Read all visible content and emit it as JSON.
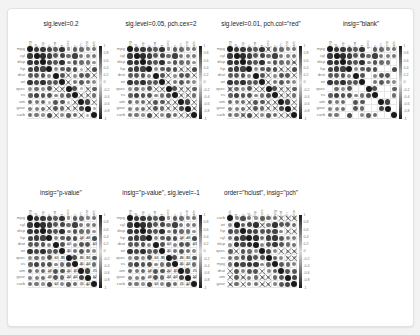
{
  "chart_data": {
    "type": "heatmap",
    "subtype": "correlation matrix (corrplot circles)",
    "variables": [
      "mpg",
      "cyl",
      "disp",
      "hp",
      "drat",
      "wt",
      "qsec",
      "vs",
      "am",
      "gear",
      "carb"
    ],
    "hclust_order": [
      "carb",
      "wt",
      "hp",
      "cyl",
      "disp",
      "qsec",
      "vs",
      "mpg",
      "drat",
      "am",
      "gear"
    ],
    "colorbar_ticks": [
      "1",
      "0.8",
      "0.6",
      "0.4",
      "0.2",
      "0",
      "-0.2",
      "-0.4",
      "-0.6",
      "-0.8",
      "-1"
    ],
    "legend_position": "right",
    "grid": true,
    "correlation": [
      [
        1.0,
        -0.85,
        -0.85,
        -0.78,
        0.68,
        -0.87,
        0.42,
        0.66,
        0.6,
        0.48,
        -0.55
      ],
      [
        -0.85,
        1.0,
        0.9,
        0.83,
        -0.7,
        0.78,
        -0.59,
        -0.81,
        -0.52,
        -0.49,
        0.53
      ],
      [
        -0.85,
        0.9,
        1.0,
        0.79,
        -0.71,
        0.89,
        -0.43,
        -0.71,
        -0.59,
        -0.56,
        0.39
      ],
      [
        -0.78,
        0.83,
        0.79,
        1.0,
        -0.45,
        0.66,
        -0.71,
        -0.72,
        -0.24,
        -0.13,
        0.75
      ],
      [
        0.68,
        -0.7,
        -0.71,
        -0.45,
        1.0,
        -0.71,
        0.09,
        0.44,
        0.71,
        0.7,
        -0.09
      ],
      [
        -0.87,
        0.78,
        0.89,
        0.66,
        -0.71,
        1.0,
        -0.17,
        -0.55,
        -0.69,
        -0.58,
        0.43
      ],
      [
        0.42,
        -0.59,
        -0.43,
        -0.71,
        0.09,
        -0.17,
        1.0,
        0.74,
        -0.23,
        -0.21,
        -0.66
      ],
      [
        0.66,
        -0.81,
        -0.71,
        -0.72,
        0.44,
        -0.55,
        0.74,
        1.0,
        0.17,
        0.21,
        -0.57
      ],
      [
        0.6,
        -0.52,
        -0.59,
        -0.24,
        0.71,
        -0.69,
        -0.23,
        0.17,
        1.0,
        0.79,
        0.06
      ],
      [
        0.48,
        -0.49,
        -0.56,
        -0.13,
        0.7,
        -0.58,
        -0.21,
        0.21,
        0.79,
        1.0,
        0.27
      ],
      [
        -0.55,
        0.53,
        0.39,
        0.75,
        -0.09,
        0.43,
        -0.66,
        -0.57,
        0.06,
        0.27,
        1.0
      ]
    ],
    "panels": [
      {
        "title": "sig.level=0.2",
        "mode": "pch",
        "sig_level": 0.2,
        "order": "original"
      },
      {
        "title": "sig.level=0.05, pch.cex=2",
        "mode": "pch",
        "sig_level": 0.05,
        "order": "original"
      },
      {
        "title": "sig.level=0.01, pch.col=\"red\"",
        "mode": "pch",
        "sig_level": 0.01,
        "order": "original"
      },
      {
        "title": "insig=\"blank\"",
        "mode": "blank",
        "sig_level": 0.01,
        "order": "original"
      },
      {
        "title": "insig=\"p-value\"",
        "mode": "pvalue",
        "sig_level": 0.05,
        "order": "original"
      },
      {
        "title": "insig=\"p-value\", sig.level=-1",
        "mode": "pvalue_all",
        "sig_level": -1,
        "order": "original"
      },
      {
        "title": "order=\"hclust\", insig=\"pch\"",
        "mode": "pch",
        "sig_level": 0.05,
        "order": "hclust"
      }
    ]
  },
  "panels": [
    {
      "title": "sig.level=0.2"
    },
    {
      "title": "sig.level=0.05, pch.cex=2"
    },
    {
      "title": "sig.level=0.01, pch.col=\"red\""
    },
    {
      "title": "insig=\"blank\""
    },
    {
      "title": "insig=\"p-value\""
    },
    {
      "title": "insig=\"p-value\", sig.level=-1"
    },
    {
      "title": "order=\"hclust\", insig=\"pch\""
    }
  ],
  "colors": {
    "strong": "#1a1a1a",
    "weak": "#dcdcdc",
    "grid": "#e6e6e6",
    "cross": "#222222"
  }
}
